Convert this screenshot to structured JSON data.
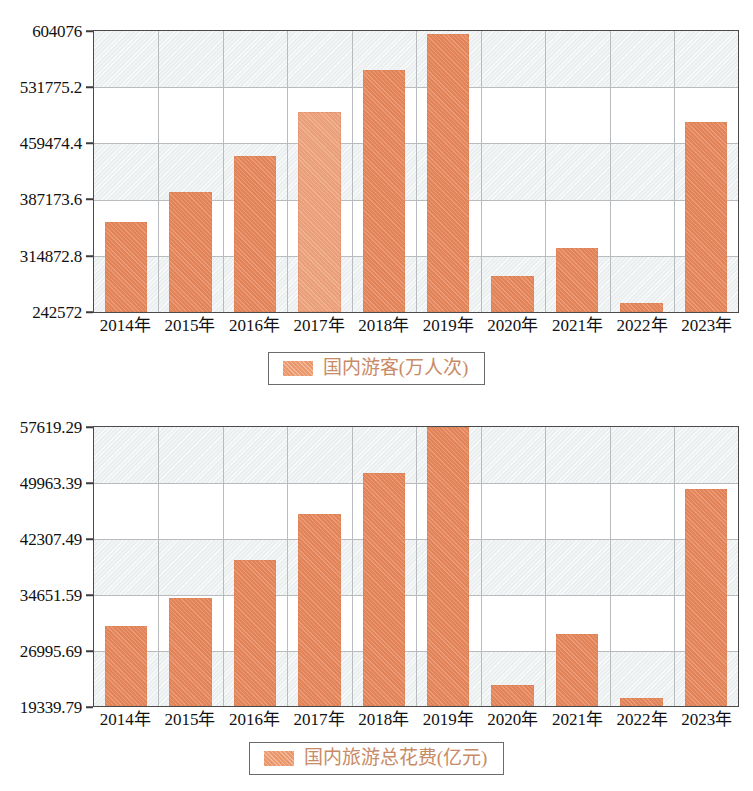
{
  "chart_data": [
    {
      "id": "domestic-tourists",
      "type": "bar",
      "title": "",
      "xlabel": "",
      "ylabel": "",
      "legend": "国内游客(万人次)",
      "legend_position": "bottom-center",
      "grid": true,
      "ylim": [
        242572,
        604076
      ],
      "yticks": [
        "242572",
        "314872.8",
        "387173.6",
        "459474.4",
        "531775.2",
        "604076"
      ],
      "ytick_values": [
        242572,
        314872.8,
        387173.6,
        459474.4,
        531775.2,
        604076
      ],
      "categories": [
        "2014年",
        "2015年",
        "2016年",
        "2017年",
        "2018年",
        "2019年",
        "2020年",
        "2021年",
        "2022年",
        "2023年"
      ],
      "values": [
        358000,
        397000,
        443000,
        500100,
        553900,
        600600,
        288800,
        325300,
        253600,
        487100
      ],
      "bar_color": "#e9885c",
      "highlight_index": 3,
      "highlight_color": "#efa47e"
    },
    {
      "id": "domestic-tourism-expenditure",
      "type": "bar",
      "title": "",
      "xlabel": "",
      "ylabel": "",
      "legend": "国内旅游总花费(亿元)",
      "legend_position": "bottom-center",
      "grid": true,
      "ylim": [
        19339.79,
        57619.29
      ],
      "yticks": [
        "19339.79",
        "26995.69",
        "34651.59",
        "42307.49",
        "49963.39",
        "57619.29"
      ],
      "ytick_values": [
        19339.79,
        26995.69,
        34651.59,
        42307.49,
        49963.39,
        57619.29
      ],
      "categories": [
        "2014年",
        "2015年",
        "2016年",
        "2017年",
        "2018年",
        "2019年",
        "2020年",
        "2021年",
        "2022年",
        "2023年"
      ],
      "values": [
        30311.9,
        34195.1,
        39390.0,
        45660.0,
        51278.0,
        57619.29,
        22286.0,
        29191.0,
        20444.0,
        49133.0
      ],
      "bar_color": "#e9885c"
    }
  ],
  "charts": {
    "top": {
      "yticks": [
        "604076",
        "531775.2",
        "459474.4",
        "387173.6",
        "314872.8",
        "242572"
      ],
      "xticks": [
        "2014年",
        "2015年",
        "2016年",
        "2017年",
        "2018年",
        "2019年",
        "2020年",
        "2021年",
        "2022年",
        "2023年"
      ],
      "legend_label": "国内游客(万人次)"
    },
    "bottom": {
      "yticks": [
        "57619.29",
        "49963.39",
        "42307.49",
        "34651.59",
        "26995.69",
        "19339.79"
      ],
      "xticks": [
        "2014年",
        "2015年",
        "2016年",
        "2017年",
        "2018年",
        "2019年",
        "2020年",
        "2021年",
        "2022年",
        "2023年"
      ],
      "legend_label": "国内旅游总花费(亿元)"
    }
  }
}
